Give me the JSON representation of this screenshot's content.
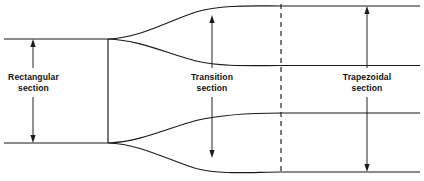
{
  "diagram": {
    "view": "plan view",
    "background_color": "#ffffff",
    "line_color": "#1a1a1a",
    "labels": [
      {
        "id": "rectangular",
        "line1": "Rectangular",
        "line2": "section"
      },
      {
        "id": "transition",
        "line1": "Transition",
        "line2": "section"
      },
      {
        "id": "trapezoidal",
        "line1": "Trapezoidal",
        "line2": "section"
      }
    ],
    "dimension_arrows": [
      {
        "id": "rectangular-width",
        "orientation": "vertical",
        "double_headed": true
      },
      {
        "id": "transition-width",
        "orientation": "vertical",
        "double_headed": true
      },
      {
        "id": "trapezoidal-width",
        "orientation": "vertical",
        "double_headed": true
      }
    ],
    "geometry": {
      "rect_top_y": 39,
      "rect_bottom_y": 143,
      "divider_x": 108,
      "dashed_x": 281,
      "trap_outer_top_y": 6,
      "trap_inner_top_y": 65.5,
      "trap_inner_bottom_y": 113,
      "trap_outer_bottom_y": 172,
      "left_edge_x": 4,
      "right_edge_x": 420
    }
  }
}
